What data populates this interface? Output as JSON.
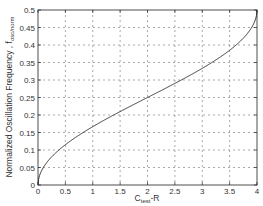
{
  "chart_data": {
    "type": "line",
    "title": "",
    "xlabel": "C_test·R",
    "xlabel_main": "C",
    "xlabel_sub": "test",
    "xlabel_tail": "-R",
    "ylabel": "Normalized Oscillation Frequency , f_osc/norm",
    "ylabel_main": "Normalized Oscillation Frequency , f",
    "ylabel_sub": "osc/norm",
    "xlim": [
      0,
      4
    ],
    "ylim": [
      0,
      0.5
    ],
    "xticks": [
      "0",
      "0.5",
      "1",
      "1.5",
      "2",
      "2.5",
      "3",
      "3.5",
      "4"
    ],
    "yticks": [
      "0",
      "0.05",
      "0.1",
      "0.15",
      "0.2",
      "0.25",
      "0.3",
      "0.35",
      "0.4",
      "0.45",
      "0.5"
    ],
    "grid": true,
    "legend": null,
    "series": [
      {
        "name": "f_osc/norm",
        "x": [
          0,
          0.05,
          0.1,
          0.2,
          0.3,
          0.5,
          0.75,
          1,
          1.25,
          1.5,
          1.75,
          2,
          2.25,
          2.5,
          2.75,
          3,
          3.25,
          3.5,
          3.7,
          3.8,
          3.9,
          3.95,
          4
        ],
        "values": [
          0,
          0.036,
          0.05,
          0.072,
          0.088,
          0.115,
          0.142,
          0.167,
          0.189,
          0.21,
          0.23,
          0.25,
          0.27,
          0.29,
          0.311,
          0.333,
          0.358,
          0.385,
          0.412,
          0.428,
          0.45,
          0.464,
          0.5
        ]
      }
    ]
  },
  "colors": {
    "line": "#222222",
    "grid": "#555555",
    "axis": "#222222"
  }
}
